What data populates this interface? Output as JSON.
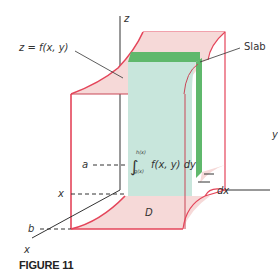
{
  "figure": {
    "caption": "FIGURE 11",
    "labels": {
      "z_axis": "z",
      "y_axis": "y",
      "x_axis": "x",
      "surface": "z = f(x, y)",
      "slab": "Slab",
      "a": "a",
      "b": "b",
      "x_tick": "x",
      "region": "D",
      "dx": "dx",
      "integral_upper": "h(x)",
      "integral_lower": "g(x)",
      "integrand": "f(x, y) dy",
      "integral_sign": "∫"
    },
    "colors": {
      "surface_fill": "#f6d9d8",
      "edge_red": "#e4455a",
      "slab_green": "#5fb86c",
      "slab_face": "#c8e6dc",
      "axis": "#333333",
      "dashed": "#333333"
    }
  }
}
